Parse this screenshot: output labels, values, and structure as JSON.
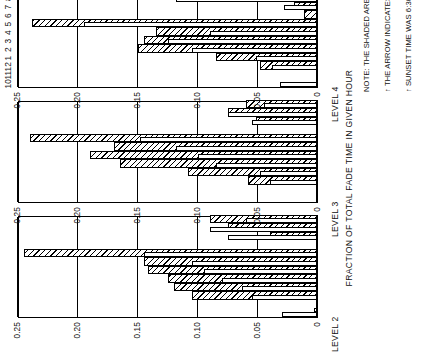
{
  "figure": {
    "axis_title": "FRACTION OF TOTAL FADE TIME IN GIVEN HOUR",
    "ytick_labels": [
      "0.25",
      "0.20",
      "0.15",
      "0.10",
      "0.05",
      "0"
    ],
    "xtick_labels": [
      "10",
      "11",
      "12",
      "1",
      "2",
      "3",
      "4",
      "5",
      "6",
      "7",
      "8",
      "9"
    ],
    "xperiod_pm": "PM",
    "xperiod_am": "AM",
    "arrow_glyph": "↑",
    "note_lines": [
      "NOTE: THE SHADED AREA IS FOR DAYS 10+43+58",
      "THE ARROW INDICATES THE AVERAGE SUNRISE TIME, THE AVERAGE",
      "SUNSET TIME WAS 6:30 P. M."
    ],
    "note_arrow_1": "↑",
    "note_arrow_2": "↑",
    "panels": [
      {
        "label": "LEVEL 2"
      },
      {
        "label": "LEVEL 3"
      },
      {
        "label": "LEVEL 4"
      }
    ]
  },
  "chart_data": {
    "type": "bar",
    "title": "",
    "xlabel": "",
    "ylabel": "FRACTION OF TOTAL FADE TIME IN GIVEN HOUR",
    "ylim": [
      0,
      0.25
    ],
    "yticks": [
      0,
      0.05,
      0.1,
      0.15,
      0.2,
      0.25
    ],
    "grid": true,
    "legend": [
      "ALL DAYS (unshaded)",
      "DAYS 10+43+58 (shaded)"
    ],
    "legend_position": "none",
    "categories": [
      "10 PM",
      "11 PM",
      "12 AM",
      "1 AM",
      "2 AM",
      "3 AM",
      "4 AM",
      "5 AM",
      "6 AM",
      "7 AM",
      "8 AM",
      "9 AM"
    ],
    "annotations": [
      {
        "text": "average sunrise time",
        "x": "7 AM",
        "glyph": "arrow-up"
      }
    ],
    "panels": [
      {
        "name": "LEVEL 2",
        "series": [
          {
            "name": "all days",
            "values": [
              0.03,
              0.0,
              0.055,
              0.063,
              0.08,
              0.095,
              0.105,
              0.145,
              0.0,
              0.075,
              0.09,
              0.06
            ]
          },
          {
            "name": "days 10+43+58",
            "values": [
              0.003,
              0.0,
              0.105,
              0.12,
              0.125,
              0.142,
              0.145,
              0.245,
              0.0,
              0.04,
              0.075,
              0.09
            ]
          }
        ]
      },
      {
        "name": "LEVEL 3",
        "series": [
          {
            "name": "all days",
            "values": [
              0.0,
              0.0,
              0.04,
              0.048,
              0.085,
              0.1,
              0.118,
              0.148,
              0.0,
              0.055,
              0.075,
              0.045
            ]
          },
          {
            "name": "days 10+43+58",
            "values": [
              0.0,
              0.0,
              0.058,
              0.108,
              0.165,
              0.19,
              0.17,
              0.24,
              0.0,
              0.052,
              0.075,
              0.06
            ]
          }
        ]
      },
      {
        "name": "LEVEL 4",
        "series": [
          {
            "name": "all days",
            "values": [
              0.032,
              0.0,
              0.038,
              0.052,
              0.105,
              0.125,
              0.09,
              0.195,
              0.0,
              0.028,
              0.118,
              0.088
            ]
          },
          {
            "name": "days 10+43+58",
            "values": [
              0.0,
              0.0,
              0.048,
              0.085,
              0.15,
              0.145,
              0.135,
              0.238,
              0.012,
              0.02,
              0.085,
              0.07
            ]
          }
        ]
      }
    ]
  }
}
